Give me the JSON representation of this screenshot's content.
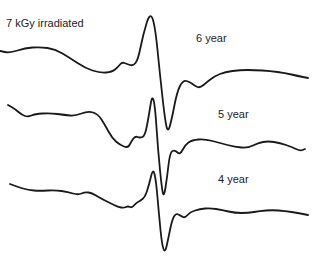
{
  "chart_data": {
    "type": "line",
    "title": "7 kGy irradiated",
    "xlabel": "",
    "ylabel": "",
    "grid": false,
    "axes_visible": false,
    "legend_position": "inline labels right of each trace",
    "series": [
      {
        "name": "6 year",
        "label_pos": [
          196,
          42
        ],
        "points": [
          [
            0,
            51
          ],
          [
            10,
            53
          ],
          [
            25,
            48
          ],
          [
            40,
            47
          ],
          [
            55,
            49
          ],
          [
            70,
            58
          ],
          [
            85,
            68
          ],
          [
            100,
            73
          ],
          [
            112,
            72
          ],
          [
            118,
            67
          ],
          [
            122,
            62
          ],
          [
            127,
            64
          ],
          [
            133,
            66
          ],
          [
            138,
            60
          ],
          [
            143,
            35
          ],
          [
            150,
            12
          ],
          [
            155,
            25
          ],
          [
            160,
            75
          ],
          [
            165,
            120
          ],
          [
            168,
            133
          ],
          [
            172,
            118
          ],
          [
            177,
            92
          ],
          [
            183,
            80
          ],
          [
            190,
            82
          ],
          [
            195,
            86
          ],
          [
            200,
            88
          ],
          [
            207,
            82
          ],
          [
            215,
            76
          ],
          [
            225,
            72
          ],
          [
            240,
            70
          ],
          [
            255,
            70
          ],
          [
            270,
            71
          ],
          [
            285,
            73
          ],
          [
            298,
            76
          ],
          [
            308,
            78
          ]
        ]
      },
      {
        "name": "5 year",
        "label_pos": [
          218,
          118
        ],
        "points": [
          [
            8,
            105
          ],
          [
            15,
            109
          ],
          [
            22,
            115
          ],
          [
            28,
            117
          ],
          [
            35,
            114
          ],
          [
            50,
            113
          ],
          [
            65,
            115
          ],
          [
            75,
            116
          ],
          [
            88,
            111
          ],
          [
            98,
            114
          ],
          [
            105,
            125
          ],
          [
            112,
            138
          ],
          [
            120,
            145
          ],
          [
            128,
            148
          ],
          [
            131,
            142
          ],
          [
            135,
            136
          ],
          [
            140,
            138
          ],
          [
            145,
            136
          ],
          [
            149,
            115
          ],
          [
            152,
            95
          ],
          [
            155,
            105
          ],
          [
            158,
            150
          ],
          [
            162,
            190
          ],
          [
            164,
            197
          ],
          [
            167,
            178
          ],
          [
            170,
            152
          ],
          [
            175,
            150
          ],
          [
            180,
            155
          ],
          [
            185,
            145
          ],
          [
            192,
            140
          ],
          [
            205,
            139
          ],
          [
            220,
            143
          ],
          [
            235,
            147
          ],
          [
            248,
            148
          ],
          [
            258,
            143
          ],
          [
            268,
            141
          ],
          [
            280,
            143
          ],
          [
            292,
            147
          ],
          [
            300,
            151
          ],
          [
            305,
            149
          ]
        ]
      },
      {
        "name": "4 year",
        "label_pos": [
          218,
          183
        ],
        "points": [
          [
            10,
            184
          ],
          [
            18,
            187
          ],
          [
            28,
            190
          ],
          [
            40,
            191
          ],
          [
            55,
            190
          ],
          [
            68,
            192
          ],
          [
            78,
            195
          ],
          [
            85,
            192
          ],
          [
            92,
            193
          ],
          [
            100,
            198
          ],
          [
            110,
            203
          ],
          [
            118,
            207
          ],
          [
            124,
            208
          ],
          [
            128,
            206
          ],
          [
            132,
            208
          ],
          [
            136,
            203
          ],
          [
            140,
            201
          ],
          [
            145,
            197
          ],
          [
            149,
            185
          ],
          [
            153,
            168
          ],
          [
            156,
            180
          ],
          [
            159,
            215
          ],
          [
            162,
            245
          ],
          [
            165,
            253
          ],
          [
            168,
            240
          ],
          [
            172,
            220
          ],
          [
            176,
            213
          ],
          [
            181,
            216
          ],
          [
            185,
            218
          ],
          [
            190,
            212
          ],
          [
            200,
            209
          ],
          [
            210,
            208
          ],
          [
            222,
            210
          ],
          [
            235,
            213
          ],
          [
            248,
            213
          ],
          [
            260,
            211
          ],
          [
            272,
            210
          ],
          [
            285,
            211
          ],
          [
            298,
            213
          ],
          [
            308,
            215
          ]
        ]
      }
    ]
  }
}
